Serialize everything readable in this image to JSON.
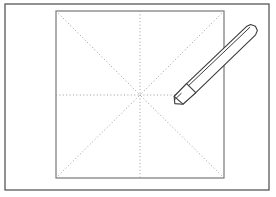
{
  "figure": {
    "canvas": {
      "width": 276,
      "height": 197,
      "background": "#ffffff"
    },
    "outer_frame": {
      "name": "outer-border-rectangle",
      "x": 5,
      "y": 4,
      "width": 264,
      "height": 186,
      "stroke": "#4a4a4a",
      "stroke_width": 1.2,
      "fill": "#ffffff"
    },
    "paper_square": {
      "name": "paper-square",
      "x": 56,
      "y": 11,
      "width": 168,
      "height": 167,
      "stroke": "#6b6b6b",
      "stroke_width": 1.1,
      "fill": "#ffffff"
    },
    "centre_point": {
      "x": 140,
      "y": 95,
      "label": "centre"
    },
    "guide_lines": {
      "stroke": "#9a9a9a",
      "stroke_width": 1,
      "dash": "1 2.4",
      "lines": [
        {
          "name": "guide-line-vertical-top",
          "x1": 140,
          "y1": 11,
          "x2": 140,
          "y2": 95
        },
        {
          "name": "guide-line-vertical-bottom",
          "x1": 140,
          "y1": 95,
          "x2": 140,
          "y2": 178
        },
        {
          "name": "guide-line-horizontal-left",
          "x1": 56,
          "y1": 95,
          "x2": 140,
          "y2": 95
        },
        {
          "name": "guide-line-horizontal-right",
          "x1": 140,
          "y1": 95,
          "x2": 175,
          "y2": 95
        },
        {
          "name": "guide-line-diagonal-top-left",
          "x1": 56,
          "y1": 11,
          "x2": 140,
          "y2": 95
        },
        {
          "name": "guide-line-diagonal-top-right",
          "x1": 224,
          "y1": 11,
          "x2": 140,
          "y2": 95
        },
        {
          "name": "guide-line-diagonal-bottom-left",
          "x1": 56,
          "y1": 178,
          "x2": 140,
          "y2": 95
        },
        {
          "name": "guide-line-diagonal-bottom-right",
          "x1": 224,
          "y1": 178,
          "x2": 140,
          "y2": 95
        }
      ]
    },
    "pencil": {
      "name": "pencil",
      "stroke": "#3c3c3c",
      "stroke_width": 1.1,
      "fill": "#ffffff",
      "tip": {
        "x": 174,
        "y": 96
      },
      "tail": {
        "x": 256,
        "y": 32
      },
      "body_outline": "174.2,96.4 186.6,83.6 246.4,26.6 250.6,24.6 255.4,26.2 257.4,30.4 255.6,34.8 195.8,92.6 183.0,104.2 174.8,103.6",
      "tip_cone": "174.2,96.4 186.6,83.6 195.8,92.6 183.0,104.2",
      "shaft_edge_line": {
        "x1": 188.6,
        "y1": 85.6,
        "x2": 249.8,
        "y2": 27.4
      },
      "tip_nib_line": {
        "x1": 174.6,
        "y1": 99.8,
        "x2": 181.2,
        "y2": 93.4
      }
    },
    "counts": {
      "guide_line_total": 8,
      "square_corners": 4
    }
  },
  "labels": {
    "alt_text": "Line drawing: a square sheet of paper inside a rectangular border, marked with eight dotted guide lines radiating from the centre, and a pencil whose tip touches the right end of the horizontal centre line."
  }
}
